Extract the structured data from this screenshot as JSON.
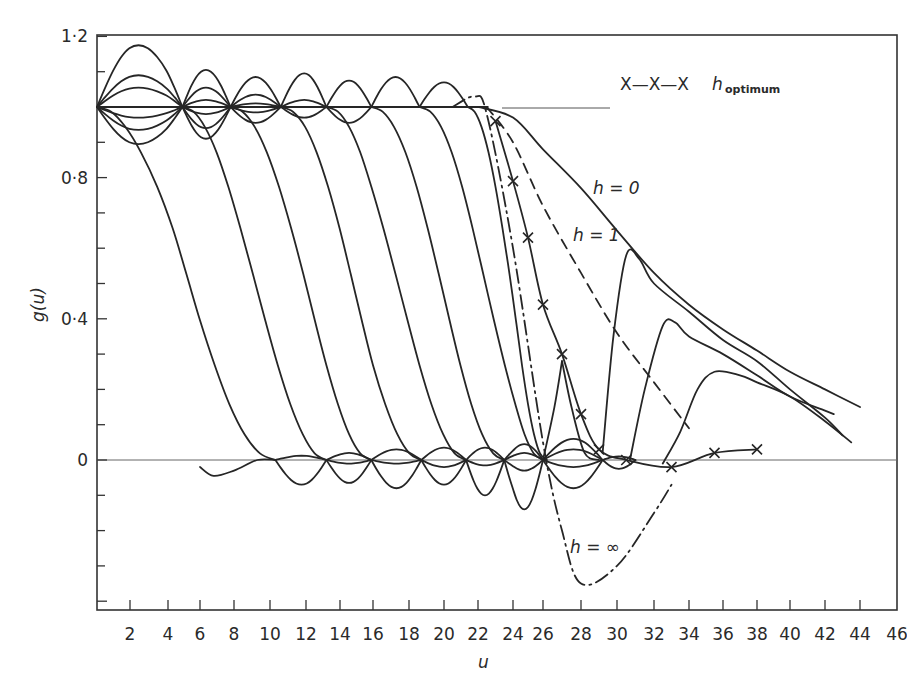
{
  "chart_data": {
    "type": "line",
    "title": "",
    "xlabel": "u",
    "ylabel": "g(u)",
    "xlim": [
      0,
      46
    ],
    "ylim": [
      -0.4,
      1.2
    ],
    "grid": false,
    "x_ticks": [
      2,
      4,
      6,
      8,
      10,
      12,
      14,
      16,
      18,
      20,
      22,
      24,
      26,
      28,
      30,
      32,
      34,
      36,
      38,
      40,
      42,
      44,
      46
    ],
    "x_tick_labels": [
      "2",
      "4",
      "6",
      "8",
      "10",
      "12",
      "14",
      "16",
      "18",
      "20",
      "22",
      "24",
      "26",
      "28",
      "30",
      "32",
      "34",
      "36",
      "38",
      "40",
      "42",
      "44",
      "46"
    ],
    "y_tick_labels": [
      {
        "value": 1.2,
        "label": "1·2"
      },
      {
        "value": 0.8,
        "label": "0·8"
      },
      {
        "value": 0.4,
        "label": "0·4"
      },
      {
        "value": 0,
        "label": "0"
      }
    ],
    "legend": {
      "marker": "X—X—X",
      "label": "h",
      "subscript": "optimum",
      "position": "upper right"
    },
    "annotations": [
      {
        "text": "h = 0",
        "x": 29.5,
        "y": 0.82
      },
      {
        "text": "h = 1",
        "x": 25.5,
        "y": 0.68
      },
      {
        "text": "h = ∞",
        "x": 25,
        "y": -0.24
      }
    ],
    "series": [
      {
        "name": "h = 0",
        "style": "solid",
        "points": [
          [
            22,
            1.0
          ],
          [
            24,
            0.97
          ],
          [
            26,
            0.88
          ],
          [
            28,
            0.77
          ],
          [
            30,
            0.65
          ],
          [
            32,
            0.53
          ],
          [
            34,
            0.44
          ],
          [
            36,
            0.37
          ],
          [
            38,
            0.31
          ],
          [
            40,
            0.25
          ],
          [
            42,
            0.2
          ],
          [
            44,
            0.15
          ]
        ]
      },
      {
        "name": "h = 1",
        "style": "dashed",
        "points": [
          [
            22.5,
            1.0
          ],
          [
            24,
            0.9
          ],
          [
            26,
            0.72
          ],
          [
            28,
            0.53
          ],
          [
            30,
            0.36
          ],
          [
            32,
            0.22
          ],
          [
            34,
            0.09
          ]
        ]
      },
      {
        "name": "h = ∞",
        "style": "dash-dot",
        "points": [
          [
            20.5,
            1.0
          ],
          [
            21.8,
            1.03
          ],
          [
            22.5,
            0.98
          ],
          [
            24,
            0.6
          ],
          [
            26,
            0.05
          ],
          [
            27,
            -0.2
          ],
          [
            28,
            -0.35
          ],
          [
            30,
            -0.3
          ],
          [
            32,
            -0.15
          ],
          [
            33,
            -0.07
          ]
        ]
      },
      {
        "name": "h optimum",
        "style": "solid-x",
        "points": [
          [
            23,
            0.96
          ],
          [
            24,
            0.79
          ],
          [
            25,
            0.63
          ],
          [
            26,
            0.44
          ],
          [
            27,
            0.3
          ],
          [
            28,
            0.13
          ],
          [
            29,
            0.03
          ],
          [
            30.5,
            0.0
          ],
          [
            33,
            -0.02
          ],
          [
            35.5,
            0.02
          ],
          [
            38,
            0.03
          ]
        ]
      },
      {
        "name": "oscillating families",
        "style": "solid",
        "note": "Family of curves oscillating about g=1 for small u with nodes near u≈0,5,7.5,10.5,13,16,19,22 and dropping to oscillate about g=0 with nodes near u≈10,13,16,19,22,24,26,29"
      }
    ]
  }
}
